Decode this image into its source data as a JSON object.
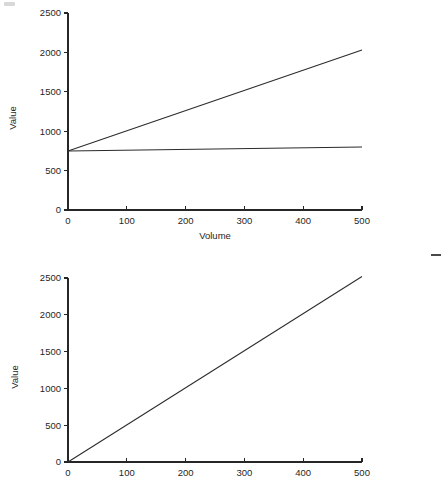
{
  "page": {
    "background_color": "#ffffff",
    "width": 441,
    "height": 482
  },
  "artifacts": {
    "corner_smudge_label": "",
    "right_edge_dash_label": ""
  },
  "chart_data": [
    {
      "id": "top",
      "type": "line",
      "title": "",
      "subtitle": "",
      "xlabel": "Volume",
      "ylabel": "Value",
      "xlim": [
        0,
        500
      ],
      "ylim": [
        0,
        2500
      ],
      "xticks": [
        0,
        100,
        200,
        300,
        400,
        500
      ],
      "yticks": [
        0,
        500,
        1000,
        1500,
        2000,
        2500
      ],
      "xtick_labels": [
        "0",
        "100",
        "200",
        "300",
        "400",
        "500"
      ],
      "ytick_labels": [
        "0",
        "500",
        "1000",
        "1500",
        "2000",
        "2500"
      ],
      "grid": false,
      "legend": false,
      "legend_position": "none",
      "line_color": "#2b2b2b",
      "x": [
        0,
        500
      ],
      "series": [
        {
          "name": "steep-line",
          "values": [
            750,
            2030
          ],
          "annotation": ""
        },
        {
          "name": "flat-line",
          "values": [
            750,
            800
          ],
          "annotation": ""
        }
      ]
    },
    {
      "id": "bottom",
      "type": "line",
      "title": "",
      "subtitle": "",
      "xlabel": "",
      "ylabel": "Value",
      "xlim": [
        0,
        500
      ],
      "ylim": [
        0,
        2500
      ],
      "xticks": [
        0,
        100,
        200,
        300,
        400,
        500
      ],
      "yticks": [
        0,
        500,
        1000,
        1500,
        2000,
        2500
      ],
      "xtick_labels": [
        "0",
        "100",
        "200",
        "300",
        "400",
        "500"
      ],
      "ytick_labels": [
        "0",
        "500",
        "1000",
        "1500",
        "2000",
        "2500"
      ],
      "grid": false,
      "legend": false,
      "legend_position": "none",
      "line_color": "#2b2b2b",
      "x": [
        0,
        500
      ],
      "series": [
        {
          "name": "rising-line",
          "values": [
            0,
            2520
          ],
          "annotation": ""
        }
      ]
    }
  ]
}
